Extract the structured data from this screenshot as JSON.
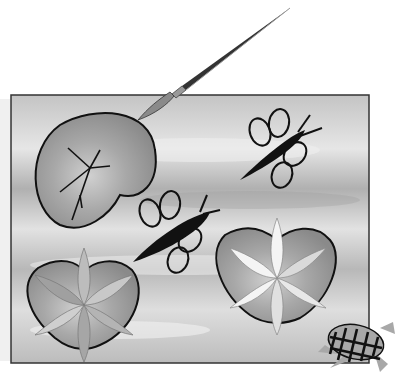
{
  "illustration": {
    "title": "Painted canvas with lily pads, bugs, turtle and paintbrush",
    "style": "grayscale clip art",
    "canvas": {
      "x": 11,
      "y": 95,
      "width": 358,
      "height": 268
    },
    "colors": {
      "background": "#ffffff",
      "canvas_light": "#e2e2e2",
      "canvas_dark": "#a9a9a9",
      "outline": "#111111",
      "pad_fill": "#9c9c9c",
      "petal_light": "#f4f4f4",
      "petal_mid": "#bdbdbd",
      "turtle_fill": "#a8a8a8"
    },
    "elements": [
      "paintbrush",
      "lily-pad-top-left",
      "bug-top-right",
      "bug-center",
      "lotus-flower-bottom-left",
      "lotus-flower-bottom-right",
      "turtle-bottom-right"
    ]
  }
}
